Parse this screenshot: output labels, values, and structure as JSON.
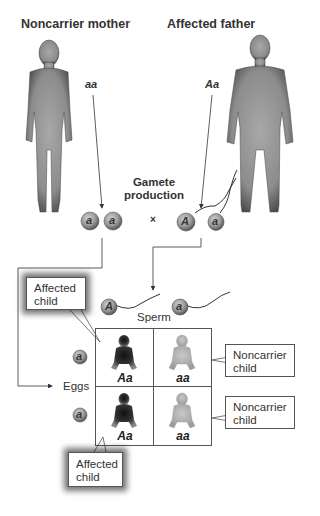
{
  "parents": {
    "mother": {
      "label": "Noncarrier mother",
      "genotype": "aa"
    },
    "father": {
      "label": "Affected father",
      "genotype": "Aa"
    }
  },
  "gamete_production": {
    "line1": "Gamete",
    "line2": "production"
  },
  "cross_symbol": "×",
  "eggs_top": [
    "a",
    "a"
  ],
  "sperm_top": [
    "A",
    "a"
  ],
  "sperm_row": {
    "label": "Sperm",
    "alleles": [
      "A",
      "a"
    ]
  },
  "eggs_col": {
    "label": "Eggs",
    "alleles": [
      "a",
      "a"
    ]
  },
  "punnett": {
    "cells": [
      [
        {
          "genotype": "Aa",
          "phenotype": "affected"
        },
        {
          "genotype": "aa",
          "phenotype": "noncarrier"
        }
      ],
      [
        {
          "genotype": "Aa",
          "phenotype": "affected"
        },
        {
          "genotype": "aa",
          "phenotype": "noncarrier"
        }
      ]
    ]
  },
  "callouts": {
    "affected_top": {
      "line1": "Affected",
      "line2": "child"
    },
    "affected_bottom": {
      "line1": "Affected",
      "line2": "child"
    },
    "noncarrier_top": {
      "line1": "Noncarrier",
      "line2": "child"
    },
    "noncarrier_bottom": {
      "line1": "Noncarrier",
      "line2": "child"
    }
  },
  "colors": {
    "affected": "#2a2a2a",
    "noncarrier": "#b8b8b8",
    "body": "#8a8a8a",
    "gamete": "#9a9a9a"
  }
}
